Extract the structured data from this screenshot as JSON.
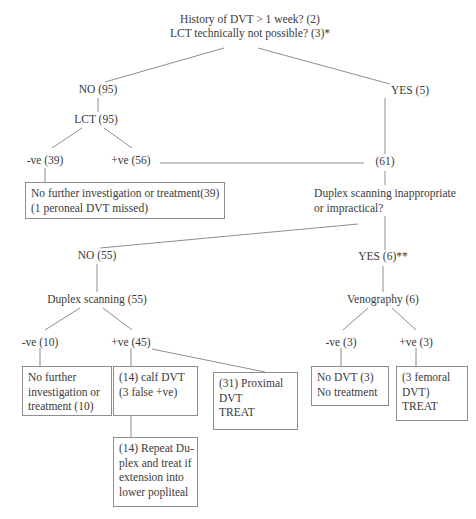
{
  "figure": {
    "type": "flowchart",
    "title_lines": [
      "History of DVT > 1 week? (2)",
      "LCT technically not possible? (3)*"
    ]
  },
  "nodes": {
    "no_95": "NO (95)",
    "yes_5": "YES (5)",
    "lct_95": "LCT (95)",
    "neg_39": "-ve (39)",
    "pos_56": "+ve (56)",
    "n_61": "(61)",
    "duplex_q_line1": "Duplex scanning inappropriate",
    "duplex_q_line2": "or impractical?",
    "no_55": "NO (55)",
    "yes_6": "YES (6)**",
    "duplex_scanning_55": "Duplex scanning (55)",
    "venography_6": "Venography (6)",
    "neg_10": "-ve (10)",
    "pos_45": "+ve (45)",
    "neg_3": "-ve (3)",
    "pos_3": "+ve (3)"
  },
  "boxes": {
    "no_further_39": {
      "lines": [
        "No further investigation or treatment(39)",
        "(1 peroneal DVT missed)"
      ]
    },
    "no_further_10": {
      "lines": [
        "No further",
        "investigation  or",
        "treatment (10)"
      ]
    },
    "calf_dvt_14": {
      "lines": [
        "(14) calf DVT",
        "(3 false +ve)"
      ]
    },
    "proximal_dvt_31": {
      "lines": [
        "(31)  Proximal",
        "DVT",
        "TREAT"
      ]
    },
    "no_dvt_3": {
      "lines": [
        "No DVT (3)",
        "No treatment"
      ]
    },
    "femoral_dvt_3": {
      "lines": [
        "(3      femoral",
        "DVT)",
        "TREAT"
      ]
    },
    "repeat_duplex_14": {
      "lines": [
        "(14) Repeat Du-",
        "plex and treat if",
        "extension    into",
        "lower popliteal"
      ]
    }
  },
  "style": {
    "line_color": "#8d8d8d",
    "text_color": "#3a3a3a",
    "background": "#ffffff"
  }
}
